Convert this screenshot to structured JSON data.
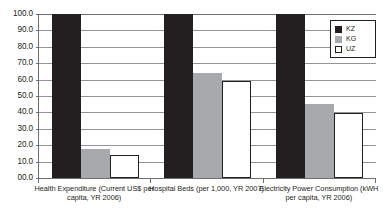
{
  "chart_data": {
    "type": "bar",
    "title": "",
    "subtitle": "",
    "xlabel": "",
    "ylabel": "",
    "categories": [
      "Health Expenditure (Current US$ per capita, YR 2006)",
      "Hospital Beds (per 1,000, YR 2007)",
      "Electricity Power Consumption (kWH per capita, YR 2006)"
    ],
    "series": [
      {
        "name": "KZ",
        "color": "#231f20",
        "values": [
          100,
          100,
          100
        ],
        "clipped": [
          true,
          true,
          true
        ]
      },
      {
        "name": "KG",
        "color": "#a7a9ac",
        "values": [
          17.5,
          64.0,
          45.0
        ],
        "clipped": [
          false,
          false,
          false
        ]
      },
      {
        "name": "UZ",
        "color": "#ffffff",
        "values": [
          14.0,
          59.0,
          39.5
        ],
        "clipped": [
          false,
          false,
          false
        ]
      }
    ],
    "ylim": [
      0,
      100
    ],
    "ytick_step": 10,
    "ytick_labels": [
      "100.0",
      "90.0",
      "80.0",
      "70.0",
      "60.0",
      "50.0",
      "40.0",
      "30.0",
      "20.0",
      "10.0",
      "00.0"
    ],
    "ytick_values": [
      100,
      90,
      80,
      70,
      60,
      50,
      40,
      30,
      20,
      10,
      0
    ],
    "grid": true,
    "grid_axis": "y",
    "legend_position": "top-right",
    "legend_entries": [
      "KZ",
      "KG",
      "UZ"
    ],
    "annotations": []
  },
  "legend": {
    "items": [
      {
        "label": "KZ",
        "swatch": "filled-black-square-icon"
      },
      {
        "label": "KG",
        "swatch": "filled-gray-square-icon"
      },
      {
        "label": "UZ",
        "swatch": "outlined-white-square-icon"
      }
    ]
  },
  "colors": {
    "series_kz": "#231f20",
    "series_kg": "#a7a9ac",
    "series_uz": "#ffffff",
    "gridline": "#939598",
    "axis": "#6d6e71",
    "text": "#231f20",
    "background": "#ffffff"
  }
}
